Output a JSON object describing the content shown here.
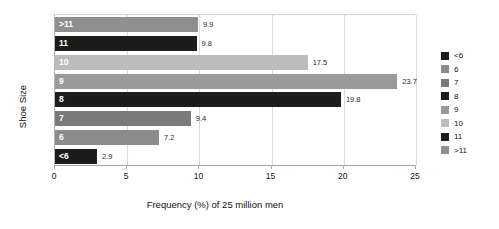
{
  "chart_data": {
    "type": "bar",
    "orientation": "horizontal",
    "title": "",
    "xlabel": "Frequency (%) of 25 million men",
    "ylabel": "Shoe Size",
    "categories": [
      "<6",
      "6",
      "7",
      "8",
      "9",
      "10",
      "11",
      ">11"
    ],
    "values": [
      2.9,
      7.2,
      9.4,
      19.8,
      23.7,
      17.5,
      9.8,
      9.9
    ],
    "value_labels": [
      "2.9",
      "7.2",
      "9.4",
      "19.8",
      "23.7",
      "17.5",
      "9.8",
      "9.9"
    ],
    "colors": [
      "#1c1c1c",
      "#8c8c8c",
      "#7a7a7a",
      "#1c1c1c",
      "#9a9a9a",
      "#bcbcbc",
      "#1c1c1c",
      "#8f8f8f"
    ],
    "xlim": [
      0,
      25
    ],
    "xticks": [
      "0",
      "5",
      "10",
      "15",
      "20",
      "25"
    ],
    "grid": "vertical",
    "legend_position": "right",
    "legend": [
      {
        "label": "<6",
        "color": "#1c1c1c"
      },
      {
        "label": "6",
        "color": "#8c8c8c"
      },
      {
        "label": "7",
        "color": "#7a7a7a"
      },
      {
        "label": "8",
        "color": "#1c1c1c"
      },
      {
        "label": "9",
        "color": "#9a9a9a"
      },
      {
        "label": "10",
        "color": "#bcbcbc"
      },
      {
        "label": "11",
        "color": "#1c1c1c"
      },
      {
        "label": ">11",
        "color": "#8f8f8f"
      }
    ]
  }
}
